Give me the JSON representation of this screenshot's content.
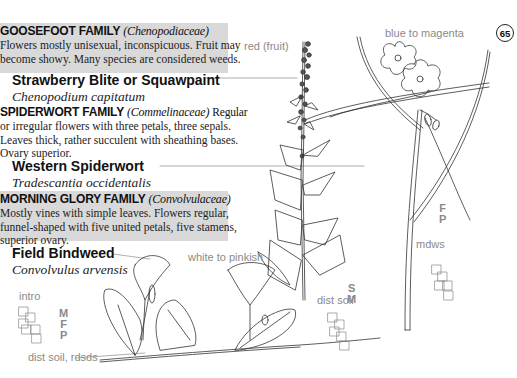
{
  "page": {
    "page_number": "65"
  },
  "families": [
    {
      "name": "GOOSEFOOT FAMILY",
      "latin": "(Chenopodiaceae)",
      "description_lines": [
        "Flowers mostly unisexual, inconspicuous. Fruit may",
        "become showy. Many species are considered weeds."
      ],
      "shaded": true,
      "species": {
        "common": "Strawberry Blite or Squawpaint",
        "latin": "Chenopodium capitatum"
      }
    },
    {
      "name": "SPIDERWORT FAMILY",
      "latin": "(Commelinaceae)",
      "inline_desc": "Regular",
      "description_lines": [
        "or irregular flowers with three petals, three sepals.",
        "Leaves thick, rather succulent with sheathing bases.",
        "Ovary superior."
      ],
      "shaded": false,
      "species": {
        "common": "Western Spiderwort",
        "latin": "Tradescantia occidentalis"
      }
    },
    {
      "name": "MORNING GLORY FAMILY",
      "latin": "(Convolvulaceae)",
      "description_lines": [
        "Mostly vines with simple leaves. Flowers regular,",
        "funnel-shaped with five united petals, five stamens,",
        "superior ovary."
      ],
      "shaded": true,
      "species": {
        "common": "Field Bindweed",
        "latin": "Convolvulus arvensis"
      }
    }
  ],
  "annotations": {
    "chenopodium_color": "red (fruit)",
    "chenopodium_habitat": "dist soil",
    "chenopodium_codes": [
      "S",
      "M"
    ],
    "tradescantia_color": "blue to magenta",
    "tradescantia_habitat": "mdws",
    "tradescantia_codes": [
      "F",
      "P"
    ],
    "convolvulus_color": "white to pinkish",
    "convolvulus_habitat": "dist soil, rdsds",
    "convolvulus_status": "intro",
    "convolvulus_codes": [
      "M",
      "F",
      "P"
    ]
  },
  "colors": {
    "shade_box": "#d9d9d9",
    "annotation_gray": "#8a8a8a",
    "text": "#222222"
  }
}
